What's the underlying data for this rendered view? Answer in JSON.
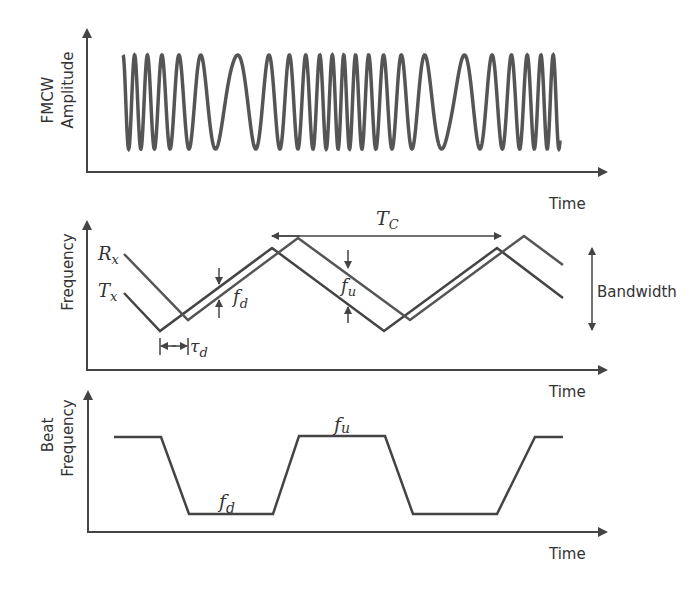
{
  "panels": {
    "amplitude": {
      "ylabel_line1": "FMCW",
      "ylabel_line2": "Amplitude",
      "xlabel": "Time"
    },
    "frequency": {
      "ylabel": "Frequency",
      "xlabel": "Time",
      "rx_label": "R",
      "rx_sub": "x",
      "tx_label": "T",
      "tx_sub": "x",
      "tc_label": "T",
      "tc_sub": "C",
      "fd_label": "f",
      "fd_sub": "d",
      "fu_label": "f",
      "fu_sub": "u",
      "tau_label": "τ",
      "tau_sub": "d",
      "bandwidth_label": "Bandwidth"
    },
    "beat": {
      "ylabel_line1": "Beat",
      "ylabel_line2": "Frequency",
      "xlabel": "Time",
      "fu_label": "f",
      "fu_sub": "u",
      "fd_label": "f",
      "fd_sub": "d"
    }
  },
  "colors": {
    "stroke": "#444444",
    "text": "#333333",
    "background": "#ffffff"
  },
  "chart_data": [
    {
      "type": "line",
      "title": "FMCW Amplitude vs Time",
      "xlabel": "Time",
      "ylabel": "FMCW Amplitude",
      "description": "Chirped sinusoid whose frequency increases then decreases repeatedly (triangular FMCW modulation)",
      "segments": 2
    },
    {
      "type": "line",
      "title": "Frequency vs Time",
      "xlabel": "Time",
      "ylabel": "Frequency",
      "series": [
        {
          "name": "Tx",
          "shape": "triangle",
          "x": [
            0,
            0.08,
            0.33,
            0.58,
            0.83,
            0.98
          ],
          "y": [
            0.45,
            0,
            1,
            0,
            1,
            0.4
          ]
        },
        {
          "name": "Rx",
          "shape": "triangle (delayed by τd, shifted by Doppler)",
          "x": [
            0,
            0.135,
            0.385,
            0.64,
            0.9,
            0.98
          ],
          "y": [
            0.85,
            0.1,
            1.1,
            0.1,
            1.1,
            0.75
          ]
        }
      ],
      "annotations": [
        "Tc (chirp period)",
        "fd (beat during up-chirp)",
        "fu (beat during down-chirp)",
        "τd (round-trip delay)",
        "Bandwidth"
      ]
    },
    {
      "type": "line",
      "title": "Beat Frequency vs Time",
      "xlabel": "Time",
      "ylabel": "Beat Frequency",
      "series": [
        {
          "name": "beat",
          "x": [
            0,
            0.1,
            0.18,
            0.38,
            0.42,
            0.54,
            0.62,
            0.8,
            0.88,
            0.94
          ],
          "y": [
            1,
            1,
            0,
            0,
            1,
            1,
            0,
            0,
            1,
            1
          ]
        }
      ],
      "annotations": [
        "fu (high level)",
        "fd (low level)"
      ]
    }
  ]
}
